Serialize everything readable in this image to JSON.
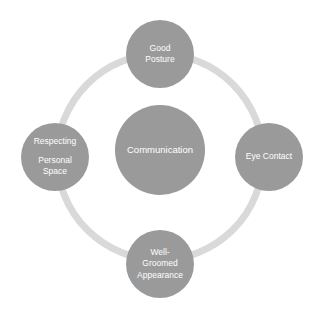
{
  "diagram": {
    "type": "cycle",
    "top_sliver_text": "",
    "ring": {
      "color": "#d9d9d9",
      "stroke_width": 7,
      "center_x": 160,
      "center_y": 157,
      "radius": 103
    },
    "node_color": "#9a9a9a",
    "text_color": "#ffffff",
    "background": "#ffffff",
    "center": {
      "id": "communication",
      "label": "Communication",
      "lines": [
        "Communication"
      ]
    },
    "nodes": [
      {
        "id": "good-posture",
        "position": "top",
        "label": "Good Posture",
        "lines": [
          "Good",
          "Posture"
        ]
      },
      {
        "id": "eye-contact",
        "position": "right",
        "label": "Eye Contact",
        "lines": [
          "Eye Contact"
        ]
      },
      {
        "id": "well-groomed-appearance",
        "position": "bottom",
        "label": "Well-Groomed Appearance",
        "lines": [
          "Well-",
          "Groomed",
          "Appearance"
        ]
      },
      {
        "id": "respecting-personal-space",
        "position": "left",
        "label": "Respecting Personal Space",
        "lines": [
          "Respecting",
          "Personal",
          "Space"
        ]
      }
    ]
  }
}
